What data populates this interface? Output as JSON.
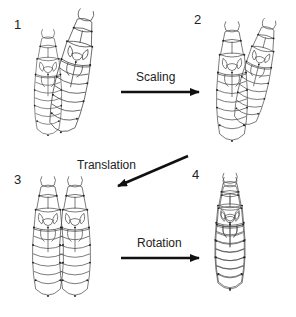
{
  "panels": [
    {
      "number": "1",
      "description": "Two overlapping insect outlines, one smaller and one larger tilted"
    },
    {
      "number": "2",
      "description": "Two overlapping insect outlines after scaling to same size"
    },
    {
      "number": "3",
      "description": "Two insect outlines side by side after translation"
    },
    {
      "number": "4",
      "description": "Two insect outlines superimposed after rotation"
    }
  ],
  "transforms": [
    {
      "label": "Scaling",
      "from": "1",
      "to": "2"
    },
    {
      "label": "Translation",
      "from": "2",
      "to": "3"
    },
    {
      "label": "Rotation",
      "from": "3",
      "to": "4"
    }
  ],
  "colors": {
    "line": "#333333",
    "background": "#ffffff",
    "arrow": "#111111"
  }
}
